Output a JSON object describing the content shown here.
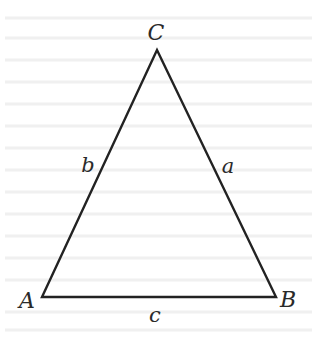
{
  "figure": {
    "type": "triangle",
    "background": "#ffffff",
    "stroke_color": "#222222",
    "stroke_width": 2.4,
    "vertices": {
      "A": {
        "label": "A",
        "x": 42,
        "y": 297,
        "label_x": 27,
        "label_y": 308
      },
      "B": {
        "label": "B",
        "x": 276,
        "y": 297,
        "label_x": 288,
        "label_y": 307
      },
      "C": {
        "label": "C",
        "x": 157,
        "y": 50,
        "label_x": 156,
        "label_y": 40
      }
    },
    "sides": {
      "a": {
        "label": "a",
        "between": "B-C",
        "label_x": 228,
        "label_y": 173
      },
      "b": {
        "label": "b",
        "between": "A-C",
        "label_x": 88,
        "label_y": 172
      },
      "c": {
        "label": "c",
        "between": "A-B",
        "label_x": 155,
        "label_y": 322
      }
    }
  }
}
